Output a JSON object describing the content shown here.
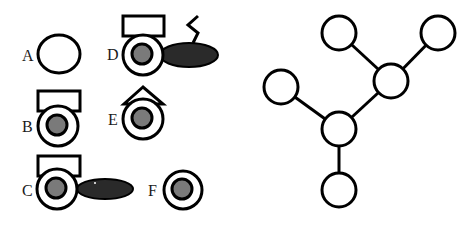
{
  "figure": {
    "width": 464,
    "height": 228,
    "colors": {
      "background": "#ffffff",
      "stroke": "#000000",
      "inner_fill": "#7a7a7a",
      "ellipse_fill": "#2a2a2a",
      "label": "#1a1a1a"
    }
  },
  "panels": {
    "left": {
      "description": "Six labeled schematic variants A–F built from rings, rectangles, triangles and ellipses",
      "items": [
        {
          "id": "A",
          "label": "A",
          "label_pos": [
            22,
            61
          ],
          "ring": {
            "cx": 59,
            "cy": 54,
            "rx": 21,
            "ry": 19
          },
          "inner": null,
          "cap": null,
          "tail": null
        },
        {
          "id": "B",
          "label": "B",
          "label_pos": [
            22,
            132
          ],
          "ring": {
            "cx": 58,
            "cy": 126,
            "rx": 20,
            "ry": 20
          },
          "inner": {
            "r": 10
          },
          "cap": {
            "type": "rect",
            "x": 38,
            "y": 91,
            "w": 42,
            "h": 20
          },
          "tail": null
        },
        {
          "id": "C",
          "label": "C",
          "label_pos": [
            22,
            196
          ],
          "ring": {
            "cx": 57,
            "cy": 189,
            "rx": 20,
            "ry": 20
          },
          "inner": {
            "r": 10
          },
          "cap": {
            "type": "rect",
            "x": 38,
            "y": 156,
            "w": 42,
            "h": 20
          },
          "tail": {
            "type": "ellipse",
            "cx": 105,
            "cy": 189,
            "rx": 28,
            "ry": 10
          }
        },
        {
          "id": "D",
          "label": "D",
          "label_pos": [
            107,
            60
          ],
          "ring": {
            "cx": 143,
            "cy": 55,
            "rx": 20,
            "ry": 20
          },
          "inner": {
            "r": 10
          },
          "cap": {
            "type": "rect",
            "x": 123,
            "y": 16,
            "w": 41,
            "h": 20
          },
          "tail": {
            "type": "ellipse",
            "cx": 189,
            "cy": 55,
            "rx": 29,
            "ry": 12
          },
          "zigzag": "198,16 188,25 198,33 193,43"
        },
        {
          "id": "E",
          "label": "E",
          "label_pos": [
            108,
            125
          ],
          "ring": {
            "cx": 143,
            "cy": 119,
            "rx": 20,
            "ry": 20
          },
          "inner": {
            "r": 10
          },
          "cap": {
            "type": "triangle",
            "points": "143,87 124,104 163,104"
          },
          "tail": null
        },
        {
          "id": "F",
          "label": "F",
          "label_pos": [
            148,
            196
          ],
          "ring": {
            "cx": 183,
            "cy": 190,
            "rx": 19,
            "ry": 19
          },
          "inner": {
            "r": 10
          },
          "cap": null,
          "tail": null
        }
      ]
    },
    "right": {
      "description": "Branched tree graph of six circular nodes",
      "node_radius": 17,
      "nodes": [
        {
          "id": "n_top_left",
          "cx": 339,
          "cy": 33
        },
        {
          "id": "n_top_right",
          "cx": 438,
          "cy": 33
        },
        {
          "id": "n_mid_right",
          "cx": 391,
          "cy": 81
        },
        {
          "id": "n_left",
          "cx": 281,
          "cy": 87
        },
        {
          "id": "n_center",
          "cx": 339,
          "cy": 129
        },
        {
          "id": "n_bottom",
          "cx": 339,
          "cy": 190
        }
      ],
      "edges": [
        [
          "n_top_left",
          "n_mid_right"
        ],
        [
          "n_top_right",
          "n_mid_right"
        ],
        [
          "n_mid_right",
          "n_center"
        ],
        [
          "n_left",
          "n_center"
        ],
        [
          "n_center",
          "n_bottom"
        ]
      ]
    }
  }
}
